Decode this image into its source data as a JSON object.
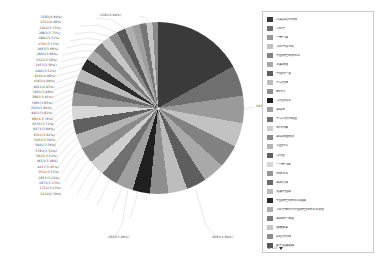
{
  "chart_data": {
    "type": "pie",
    "title": "",
    "legend_position": "right",
    "value_suffix": "",
    "label_format": "count (percent)",
    "total_label": "",
    "categories": [
      "人类命运共同体",
      "习近平",
      "一带一路",
      "习近平总书记",
      "中国特色社会主义",
      "主要治理",
      "中国共产党",
      "中华民族",
      "新时代",
      "马克思主义",
      "全球化",
      "中华人民共和国",
      "合作共赢",
      "全球治理体系",
      "大国外交",
      "马克思",
      "\"一带一路\"",
      "社会主义",
      "全面小康",
      "发展中国家",
      "中国特色社会主义道路",
      "习近平新时代中国特色社会主义思想",
      "全面从严治党",
      "普遍安全",
      "命运共同体",
      "和平发展道路",
      "中国方案",
      "社会主要矛盾",
      "绿色发展",
      "共同体意识",
      "文化自信"
    ],
    "values": [
      1954,
      663,
      598,
      521,
      498,
      471,
      432,
      411,
      398,
      381,
      372,
      364,
      351,
      341,
      332,
      316,
      301,
      287,
      272,
      261,
      247,
      236,
      221,
      208,
      196,
      184,
      171,
      158,
      146,
      133,
      121
    ],
    "percents": [
      "47%",
      "6%",
      "5%",
      "4%",
      "4%",
      "4%",
      "3%",
      "3%",
      "3%",
      "3%",
      "3%",
      "3%",
      "2%",
      "2%",
      "2%",
      "2%",
      "2%",
      "2%",
      "2%",
      "2%",
      "2%",
      "1%",
      "1%",
      "1%",
      "1%",
      "1%",
      "1%",
      "1%",
      "1%",
      "1%",
      "1%"
    ],
    "colors": [
      "#3a3a3a",
      "#6f6f6f",
      "#9a9a9a",
      "#c2c2c2",
      "#828282",
      "#a9a9a9",
      "#5e5e5e",
      "#bdbdbd",
      "#8e8e8e",
      "#1f1f1f",
      "#a0a0a0",
      "#707070",
      "#cfcfcf",
      "#8a8a8a",
      "#b4b4b4",
      "#606060",
      "#d6d6d6",
      "#959595",
      "#6a6a6a",
      "#bbbbbb",
      "#2b2b2b",
      "#adadad",
      "#7b7b7b",
      "#c8c8c8",
      "#8d8d8d",
      "#585858",
      "#b0b0b0",
      "#9e9e9e",
      "#767676",
      "#c5c5c5",
      "#898989"
    ]
  },
  "callouts": {
    "main": "1954(46.47%)",
    "bottom_left": "2893(3.06%)",
    "bottom_right": "4081(4.89%)",
    "top": "2582(4.69%)",
    "left_stack": [
      "2581(4.69%)",
      "1552(4.48%)",
      "2912(3.75%)",
      "2862(3.73%)",
      "2802(3.71%)",
      "2741(3.71%)",
      "2663(3.68%)",
      "2601(3.66%)",
      "2522(3.58%)",
      "2451(3.56%)",
      "2402(3.52%)",
      "4102(4.08%)",
      "4161(4.09%)",
      "4022(4.03%)",
      "3951(3.98%)",
      "3801(3.91%)",
      "7081(3.85%)",
      "7021(3.84%)",
      "6921(3.82%)",
      "6811(3.76%)",
      "6531(3.72%)",
      "6471(3.69%)",
      "6311(3.64%)",
      "5451(3.59%)",
      "5941(3.56%)",
      "5782(3.54%)",
      "5621(3.52%)",
      "4611(3.48%)",
      "4417(3.45%)",
      "3512(3.31%)",
      "2811(3.24%)",
      "1871(3.17%)",
      "1712(3.13%)",
      "2214(2.79%)"
    ]
  },
  "legend_pager": {
    "prev": "◄",
    "page": "1/2",
    "next": "▼"
  }
}
